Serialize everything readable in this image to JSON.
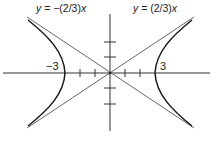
{
  "figure": {
    "type": "hyperbola-graph",
    "equation": "x^2/9 - y^2/4 = 1",
    "asymptotes": [
      {
        "label_var": "y",
        "label_eq": " = −(2/3)",
        "label_x": "x",
        "slope": -0.6667
      },
      {
        "label_var": "y",
        "label_eq": " = (2/3)",
        "label_x": "x",
        "slope": 0.6667
      }
    ],
    "vertex_labels": [
      "−3",
      "3"
    ],
    "x_ticks": [
      -2,
      -1,
      1,
      2
    ],
    "y_ticks": [
      -2,
      -1,
      1,
      2
    ],
    "colors": {
      "curve": "#1a1a1a",
      "asymptote": "#555555",
      "axis": "#333333",
      "background": "#ffffff"
    }
  }
}
